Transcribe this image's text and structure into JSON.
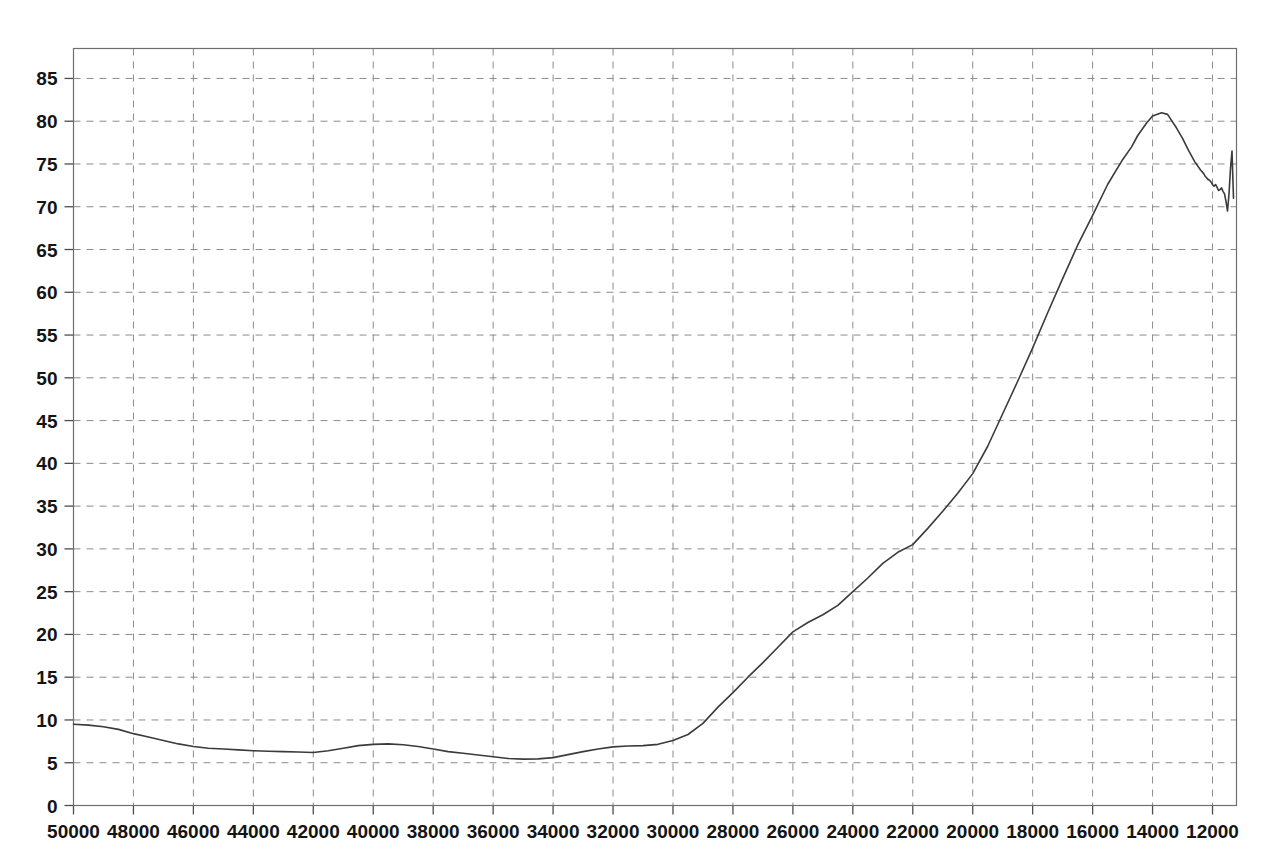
{
  "chart_data": {
    "type": "line",
    "title": "",
    "subtitle": "",
    "xlabel": "",
    "ylabel": "",
    "xlim": [
      50000,
      11200
    ],
    "ylim": [
      0,
      88.5
    ],
    "x_axis_reversed": true,
    "grid": true,
    "legend": null,
    "legend_position": "none",
    "xticks": [
      50000,
      48000,
      46000,
      44000,
      42000,
      40000,
      38000,
      36000,
      34000,
      32000,
      30000,
      28000,
      26000,
      24000,
      22000,
      20000,
      18000,
      16000,
      14000,
      12000
    ],
    "xtick_labels": [
      "50000",
      "48000",
      "46000",
      "44000",
      "42000",
      "40000",
      "38000",
      "36000",
      "34000",
      "32000",
      "30000",
      "28000",
      "26000",
      "24000",
      "22000",
      "20000",
      "18000",
      "16000",
      "14000",
      "12000"
    ],
    "yticks": [
      0,
      5,
      10,
      15,
      20,
      25,
      30,
      35,
      40,
      45,
      50,
      55,
      60,
      65,
      70,
      75,
      80,
      85
    ],
    "ytick_labels": [
      "0",
      "5",
      "10",
      "15",
      "20",
      "25",
      "30",
      "35",
      "40",
      "45",
      "50",
      "55",
      "60",
      "65",
      "70",
      "75",
      "80",
      "85"
    ],
    "line_color": "#3b3b3b",
    "grid_color": "#8c8c8c",
    "series": [
      {
        "name": "curve",
        "x": [
          50000,
          49500,
          49000,
          48500,
          48000,
          47500,
          47000,
          46500,
          46000,
          45500,
          45000,
          44500,
          44000,
          43500,
          43000,
          42500,
          42000,
          41500,
          41000,
          40500,
          40000,
          39500,
          39000,
          38500,
          38000,
          37500,
          37000,
          36500,
          36000,
          35500,
          35000,
          34500,
          34000,
          33500,
          33000,
          32500,
          32000,
          31500,
          31000,
          30500,
          30000,
          29500,
          29000,
          28500,
          28000,
          27500,
          27000,
          26500,
          26000,
          25500,
          25000,
          24500,
          24000,
          23500,
          23000,
          22500,
          22000,
          21500,
          21000,
          20500,
          20000,
          19500,
          19000,
          18500,
          18000,
          17500,
          17000,
          16500,
          16000,
          15500,
          15000,
          14700,
          14500,
          14200,
          14000,
          13700,
          13500,
          13200,
          13000,
          12800,
          12600,
          12400,
          12300,
          12250,
          12200,
          12150
        ],
        "y": [
          9.5,
          9.4,
          9.2,
          8.9,
          8.4,
          8.0,
          7.6,
          7.2,
          6.9,
          6.7,
          6.6,
          6.5,
          6.4,
          6.35,
          6.3,
          6.25,
          6.2,
          6.4,
          6.7,
          7.0,
          7.15,
          7.2,
          7.1,
          6.9,
          6.6,
          6.3,
          6.1,
          5.9,
          5.7,
          5.5,
          5.42,
          5.45,
          5.6,
          5.95,
          6.3,
          6.6,
          6.85,
          6.95,
          7.0,
          7.15,
          7.6,
          8.3,
          9.6,
          11.5,
          13.2,
          15.0,
          16.7,
          18.5,
          20.3,
          21.4,
          22.3,
          23.4,
          25.0,
          26.6,
          28.3,
          29.6,
          30.5,
          32.4,
          34.4,
          36.5,
          38.8,
          42.0,
          45.8,
          49.6,
          53.5,
          57.6,
          61.6,
          65.5,
          69.0,
          72.6,
          75.5,
          77.0,
          78.3,
          79.8,
          80.6,
          81.0,
          80.8,
          79.2,
          78.0,
          76.6,
          75.3,
          74.3,
          73.9,
          73.6,
          73.4,
          73.2
        ],
        "peak_value": 81.0,
        "peak_x": 14700,
        "start_value": 9.5,
        "min_value": 5.42,
        "min_x": 35000,
        "end_value": 72.0
      },
      {
        "name": "curve-tail",
        "x": [
          12150,
          12100,
          12050,
          12000,
          11950,
          11900,
          11850,
          11800,
          11750,
          11700,
          11650,
          11600,
          11550,
          11500,
          11450,
          11400,
          11350,
          11300
        ],
        "y": [
          73.2,
          73.1,
          72.9,
          72.6,
          72.4,
          72.6,
          72.3,
          71.9,
          72.0,
          72.2,
          71.8,
          71.5,
          70.6,
          69.5,
          71.5,
          74.5,
          76.5,
          71.0
        ]
      }
    ]
  }
}
